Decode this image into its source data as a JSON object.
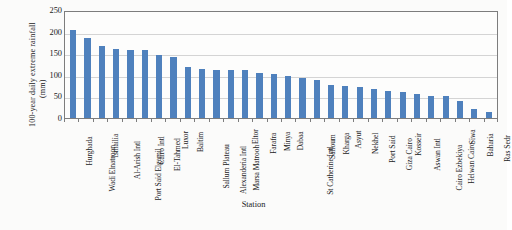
{
  "chart_data": {
    "type": "bar",
    "title": "",
    "xlabel": "Station",
    "ylabel": "100-year daily extreme rainfall",
    "ylabel_unit": "(mm)",
    "ylim": [
      0,
      250
    ],
    "yticks": [
      0,
      50,
      100,
      150,
      200,
      250
    ],
    "grid": true,
    "legend": "none",
    "bar_color": "#4F81BD",
    "categories": [
      "Hurghada",
      "Wadi Elnatroon",
      "Ismailia",
      "Al-Arish Intl",
      "Port Said Elgamil",
      "Cairo Intl",
      "El-Tahmed",
      "Luxor",
      "Baltim",
      "Sallum Plateau",
      "Alexanderia Intl",
      "Marsa Matrooh",
      "Eltor",
      "Farafra",
      "Minya",
      "Dabaa",
      "St Catherine Intl",
      "Salloum",
      "Kharga",
      "Asyut",
      "Nekhel",
      "Port Said",
      "Giza Cairo",
      "Kosseir",
      "Aswan Intl",
      "Cairo Ezbekiya",
      "Helwan Cairo",
      "Siwa",
      "Baharia",
      "Ras Sedr"
    ],
    "values": [
      203,
      186,
      167,
      159,
      158,
      158,
      145,
      141,
      119,
      113,
      112,
      110,
      110,
      104,
      102,
      98,
      92,
      88,
      77,
      73,
      71,
      68,
      63,
      61,
      55,
      52,
      51,
      40,
      21,
      14
    ]
  }
}
